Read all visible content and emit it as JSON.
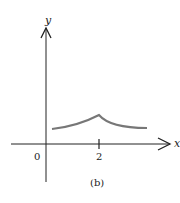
{
  "figure": {
    "caption": "(b)",
    "x_axis_label": "x",
    "y_axis_label": "y",
    "origin_label": "0",
    "tick_label": "2",
    "colors": {
      "axes": "#222222",
      "curve": "#777777",
      "background": "#ffffff"
    }
  },
  "curve": {
    "description": "Positive function with a cusp (sharp peak) at x = 2, decreasing toward a horizontal level on both sides",
    "peak_x": 2,
    "shape": "cusp"
  }
}
